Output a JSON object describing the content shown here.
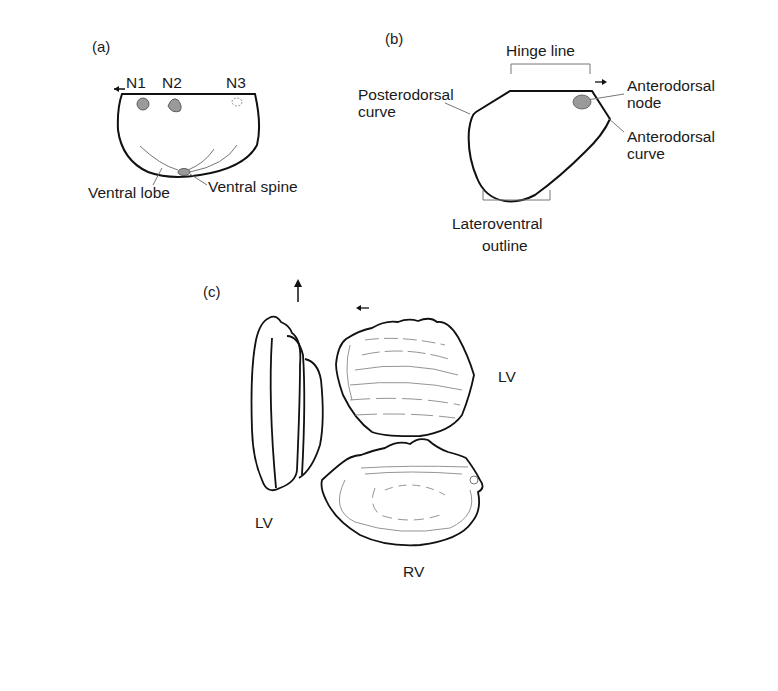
{
  "figure": {
    "panel_a": {
      "label": "(a)",
      "nodes": [
        "N1",
        "N2",
        "N3"
      ],
      "ventral_lobe": "Ventral lobe",
      "ventral_spine": "Ventral spine"
    },
    "panel_b": {
      "label": "(b)",
      "hinge_line": "Hinge line",
      "posterodorsal_curve": [
        "Posterodorsal",
        "curve"
      ],
      "anterodorsal_node": [
        "Anterodorsal",
        "node"
      ],
      "anterodorsal_curve": [
        "Anterodorsal",
        "curve"
      ],
      "lateroventral_outline": [
        "Lateroventral",
        "outline"
      ]
    },
    "panel_c": {
      "label": "(c)",
      "dorsal_view_label": "LV",
      "external_view_label": "LV",
      "internal_view_label": "RV"
    },
    "colors": {
      "outline": "#111111",
      "inner_lines": "#888888",
      "node_fill": "#9a9a9a"
    }
  }
}
